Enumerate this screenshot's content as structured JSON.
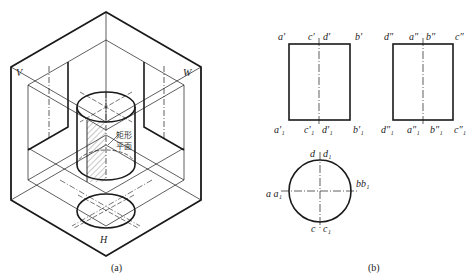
{
  "figure_a": {
    "caption": "(a)",
    "plane_labels": {
      "v": "V",
      "w": "W",
      "h": "H"
    },
    "annotation_line1": "矩形",
    "annotation_line2": "平面"
  },
  "figure_b": {
    "caption": "(b)",
    "front_view": {
      "top_labels": [
        "a′",
        "c′",
        "d′",
        "b′"
      ],
      "bottom_labels": [
        "a′₁",
        "c′₁",
        "d′₁",
        "b′₁"
      ]
    },
    "side_view": {
      "top_labels": [
        "d″",
        "a″",
        "b″",
        "c″"
      ],
      "bottom_labels": [
        "d″₁",
        "a″₁",
        "b″₁",
        "c″₁"
      ]
    },
    "top_view": {
      "top_label": "d d₁",
      "top_label_a": "d",
      "top_label_b": "d₁",
      "bottom_label_a": "c",
      "bottom_label_b": "c₁",
      "left_label": "a a₁",
      "right_label": "bb₁"
    }
  },
  "colors": {
    "line": "#1a1a1a",
    "thin": "#333333",
    "background": "#ffffff"
  }
}
